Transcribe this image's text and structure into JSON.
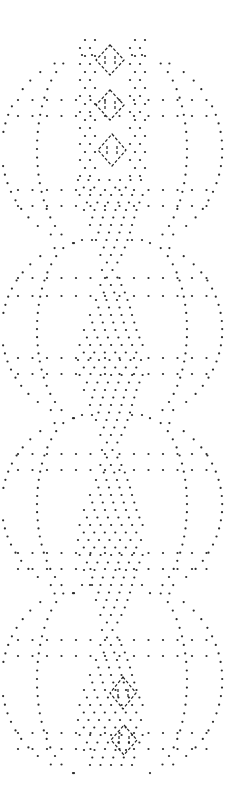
{
  "diagram": {
    "kind": "lace-pricking-pattern",
    "width": 235,
    "height": 796,
    "background": "#ffffff",
    "dot_color": "#2a2a2a",
    "dot_radius": 1.1,
    "dash_color": "#222222",
    "center_x": 112,
    "paired_rows_y": [
      100,
      116,
      190,
      206,
      278,
      296,
      358,
      374,
      454,
      470,
      553,
      569,
      640,
      656,
      733,
      749
    ],
    "paired_row_x_left": 18,
    "paired_row_x_right": 210,
    "paired_row_spacing": 14.5,
    "lattice": {
      "top": 180,
      "bottom": 770,
      "spacing": 7.5,
      "half_width_min": 10,
      "half_width_max": 34,
      "period": 180
    },
    "scallops": [
      {
        "cy": 150,
        "ry": 95,
        "rx": 95
      },
      {
        "cy": 330,
        "ry": 90,
        "rx": 95
      },
      {
        "cy": 505,
        "ry": 90,
        "rx": 95
      },
      {
        "cy": 680,
        "ry": 95,
        "rx": 95
      }
    ],
    "dashed_diamonds": [
      {
        "cx": 110,
        "cy": 60,
        "w": 28,
        "h": 30
      },
      {
        "cx": 110,
        "cy": 105,
        "w": 28,
        "h": 30
      },
      {
        "cx": 112,
        "cy": 150,
        "w": 28,
        "h": 32
      },
      {
        "cx": 123,
        "cy": 693,
        "w": 26,
        "h": 32
      },
      {
        "cx": 124,
        "cy": 740,
        "w": 26,
        "h": 30
      }
    ]
  }
}
